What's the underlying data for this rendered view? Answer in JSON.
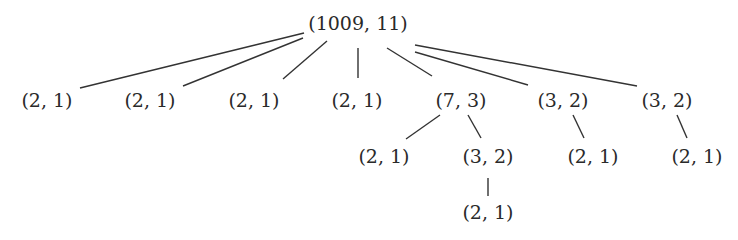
{
  "diagram": {
    "type": "tree",
    "nodes": [
      {
        "id": "n0",
        "label": "(1009, 11)",
        "parent": null
      },
      {
        "id": "n1",
        "label": "(2, 1)",
        "parent": "n0"
      },
      {
        "id": "n2",
        "label": "(2, 1)",
        "parent": "n0"
      },
      {
        "id": "n3",
        "label": "(2, 1)",
        "parent": "n0"
      },
      {
        "id": "n4",
        "label": "(2, 1)",
        "parent": "n0"
      },
      {
        "id": "n5",
        "label": "(7, 3)",
        "parent": "n0"
      },
      {
        "id": "n6",
        "label": "(3, 2)",
        "parent": "n0"
      },
      {
        "id": "n7",
        "label": "(3, 2)",
        "parent": "n0"
      },
      {
        "id": "n8",
        "label": "(2, 1)",
        "parent": "n5"
      },
      {
        "id": "n9",
        "label": "(3, 2)",
        "parent": "n5"
      },
      {
        "id": "n10",
        "label": "(2, 1)",
        "parent": "n6"
      },
      {
        "id": "n11",
        "label": "(2, 1)",
        "parent": "n7"
      },
      {
        "id": "n12",
        "label": "(2, 1)",
        "parent": "n9"
      }
    ]
  }
}
